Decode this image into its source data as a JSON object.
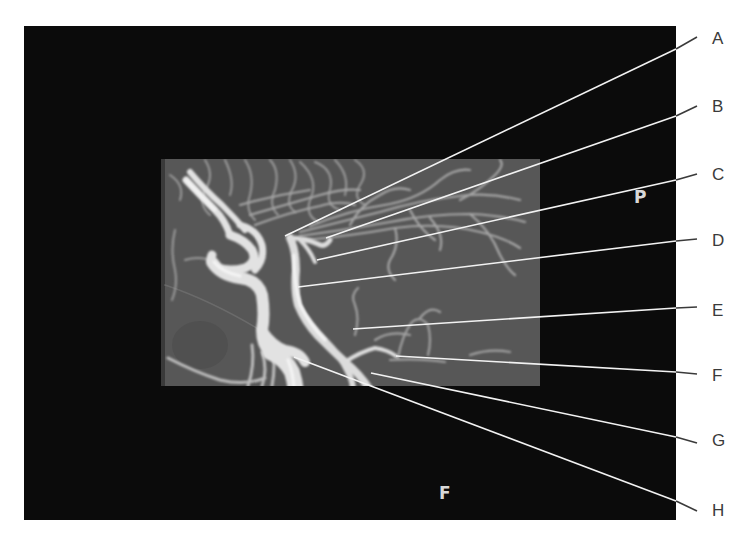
{
  "figure": {
    "type": "labeled angiogram (lateral view, carotid and cerebral arteries)",
    "frame": {
      "x": 24,
      "y": 26,
      "width": 652,
      "height": 494,
      "color": "#0b0b0b"
    },
    "scan_window": {
      "x": 161,
      "y": 159,
      "width": 379,
      "height": 227,
      "color": "#555555"
    },
    "orientation_markers": [
      {
        "id": "P",
        "text": "P",
        "x": 634,
        "y": 189
      },
      {
        "id": "F",
        "text": "F",
        "x": 439,
        "y": 485
      }
    ],
    "leader_color": "#f2f2f2",
    "labels": [
      {
        "id": "A",
        "text": "A",
        "label_x": 712,
        "label_y": 30,
        "line_from": [
          697,
          37
        ],
        "line_bend": [
          676,
          49
        ],
        "line_to": [
          285,
          236
        ]
      },
      {
        "id": "B",
        "text": "B",
        "label_x": 712,
        "label_y": 98,
        "line_from": [
          697,
          106
        ],
        "line_bend": [
          676,
          116
        ],
        "line_to": [
          326,
          238
        ]
      },
      {
        "id": "C",
        "text": "C",
        "label_x": 712,
        "label_y": 166,
        "line_from": [
          697,
          174
        ],
        "line_bend": [
          676,
          180
        ],
        "line_to": [
          317,
          260
        ]
      },
      {
        "id": "D",
        "text": "D",
        "label_x": 712,
        "label_y": 232,
        "line_from": [
          697,
          239
        ],
        "line_bend": [
          676,
          241
        ],
        "line_to": [
          298,
          287
        ]
      },
      {
        "id": "E",
        "text": "E",
        "label_x": 712,
        "label_y": 302,
        "line_from": [
          697,
          307
        ],
        "line_bend": [
          676,
          308
        ],
        "line_to": [
          353,
          329
        ]
      },
      {
        "id": "F",
        "text": "F",
        "label_x": 712,
        "label_y": 367,
        "line_from": [
          697,
          374
        ],
        "line_bend": [
          676,
          372
        ],
        "line_to": [
          396,
          356
        ]
      },
      {
        "id": "G",
        "text": "G",
        "label_x": 712,
        "label_y": 432,
        "line_from": [
          697,
          443
        ],
        "line_bend": [
          676,
          437
        ],
        "line_to": [
          371,
          373
        ]
      },
      {
        "id": "H",
        "text": "H",
        "label_x": 712,
        "label_y": 502,
        "line_from": [
          697,
          511
        ],
        "line_bend": [
          676,
          501
        ],
        "line_to": [
          294,
          357
        ]
      }
    ]
  }
}
